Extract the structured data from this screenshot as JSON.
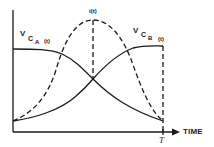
{
  "diagram": {
    "title": "",
    "colors": {
      "stroke": "#1a1a1a",
      "background": "#ffffff"
    },
    "x_axis": {
      "label": "TIME",
      "end_marker": "T"
    },
    "curves": [
      {
        "name": "vCA(t)",
        "style": "solid",
        "label": {
          "v": "V",
          "sub": "C",
          "subsub": "A",
          "arg": "(t)"
        },
        "description": "starts high, stays flat, then decreases to low at T"
      },
      {
        "name": "vCB(t)",
        "style": "solid",
        "label": {
          "v": "V",
          "sub": "C",
          "subsub": "B",
          "arg": "(t)"
        },
        "description": "starts low, increases, levels off high near T"
      },
      {
        "name": "i(t)",
        "style": "dashed",
        "label": {
          "text": "i(t)"
        },
        "description": "bell-shaped current pulse peaking at mid-interval, zero at 0 and T"
      }
    ],
    "guides": [
      {
        "name": "peak-marker",
        "style": "dashed",
        "description": "vertical dashed line from i(t) peak down to curve crossing"
      },
      {
        "name": "T-marker",
        "style": "dashed",
        "description": "vertical dashed line at T"
      }
    ]
  }
}
